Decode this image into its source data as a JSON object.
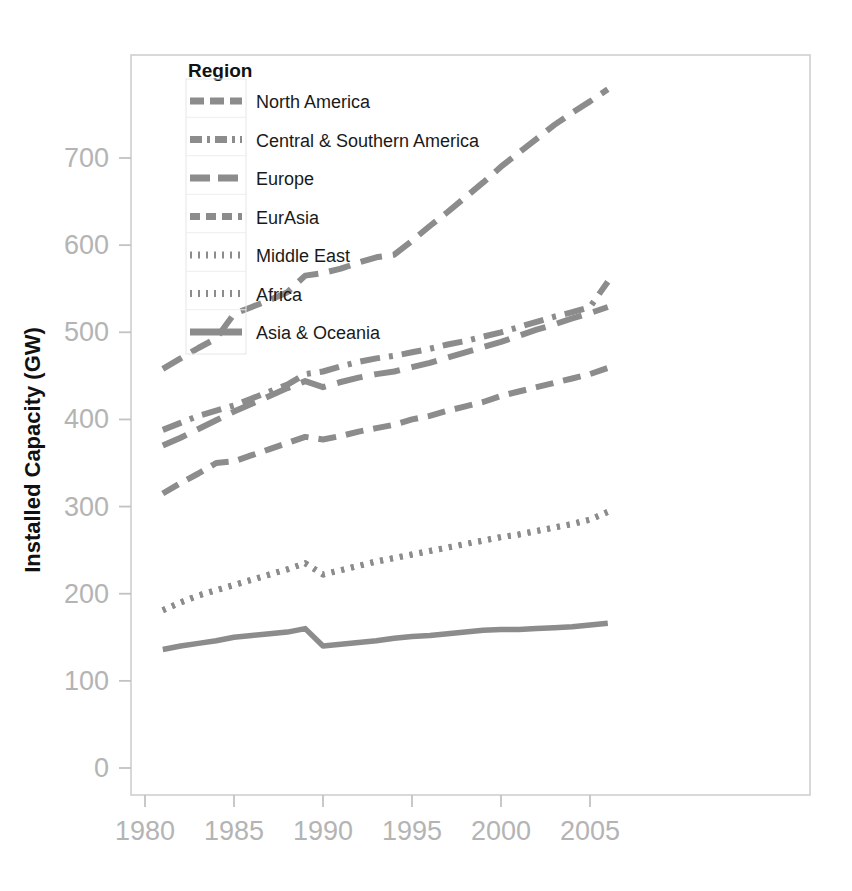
{
  "chart_data": {
    "type": "line",
    "title": "",
    "xlabel": "",
    "ylabel": "Installed Capacity (GW)",
    "xlim": [
      1980,
      2006.5
    ],
    "ylim": [
      0,
      790
    ],
    "grid": false,
    "legend_position": "top-left inside plot",
    "x_ticks": [
      1980,
      1985,
      1990,
      1995,
      2000,
      2005
    ],
    "x_tick_labels": [
      "1980",
      "1985",
      "1990",
      "1995",
      "2000",
      "2005"
    ],
    "y_ticks": [
      0,
      100,
      200,
      300,
      400,
      500,
      600,
      700
    ],
    "y_tick_labels": [
      "0",
      "100",
      "200",
      "300",
      "400",
      "500",
      "600",
      "700"
    ],
    "legend_title": "Region",
    "line_color": "#8c8c8c",
    "x": [
      1981,
      1982,
      1983,
      1984,
      1985,
      1986,
      1987,
      1988,
      1989,
      1990,
      1991,
      1992,
      1993,
      1994,
      1995,
      1996,
      1997,
      1998,
      1999,
      2000,
      2001,
      2002,
      2003,
      2004,
      2005,
      2006
    ],
    "series": [
      {
        "name": "North America",
        "dash": "22,11",
        "values": [
          458,
          470,
          482,
          493,
          521,
          529,
          537,
          546,
          565,
          568,
          573,
          580,
          586,
          589,
          605,
          622,
          638,
          655,
          672,
          690,
          706,
          722,
          738,
          752,
          765,
          779
        ]
      },
      {
        "name": "Central & Southern America",
        "dash": "20,9,4,9",
        "values": [
          388,
          396,
          404,
          410,
          416,
          424,
          432,
          440,
          452,
          455,
          461,
          466,
          470,
          473,
          477,
          481,
          486,
          490,
          495,
          500,
          506,
          512,
          518,
          523,
          529,
          558
        ]
      },
      {
        "name": "Europe",
        "dash": "26,12",
        "values": [
          370,
          379,
          389,
          399,
          409,
          418,
          427,
          436,
          444,
          437,
          443,
          448,
          452,
          455,
          460,
          465,
          471,
          477,
          483,
          489,
          496,
          503,
          509,
          516,
          522,
          529
        ]
      },
      {
        "name": "EurAsia",
        "dash": "18,10",
        "values": [
          315,
          327,
          338,
          350,
          352,
          359,
          366,
          373,
          380,
          377,
          381,
          386,
          390,
          394,
          400,
          404,
          410,
          415,
          420,
          427,
          432,
          437,
          442,
          447,
          452,
          459
        ]
      },
      {
        "name": "Middle East",
        "dash": "3,7",
        "values": [
          181,
          190,
          198,
          204,
          210,
          216,
          222,
          228,
          235,
          222,
          227,
          232,
          237,
          241,
          245,
          249,
          253,
          257,
          261,
          265,
          268,
          272,
          276,
          280,
          285,
          294
        ]
      },
      {
        "name": "Africa",
        "dash": "3,7",
        "values": [
          181,
          190,
          198,
          204,
          210,
          216,
          222,
          228,
          235,
          222,
          227,
          232,
          237,
          241,
          245,
          249,
          253,
          257,
          261,
          265,
          268,
          272,
          276,
          280,
          285,
          294
        ]
      },
      {
        "name": "Asia & Oceania",
        "dash": "0",
        "values": [
          136,
          140,
          143,
          146,
          150,
          152,
          154,
          156,
          160,
          140,
          142,
          144,
          146,
          149,
          151,
          152,
          154,
          156,
          158,
          159,
          159,
          160,
          161,
          162,
          164,
          166
        ]
      }
    ],
    "legend_entries": [
      {
        "label": "North America",
        "dash": "14,6"
      },
      {
        "label": "Central & Southern America",
        "dash": "12,5,3,5"
      },
      {
        "label": "Europe",
        "dash": "20,8"
      },
      {
        "label": "EurAsia",
        "dash": "10,6"
      },
      {
        "label": "Middle East",
        "dash": "2,6"
      },
      {
        "label": "Africa",
        "dash": "2,6"
      },
      {
        "label": "Asia & Oceania",
        "dash": "0"
      }
    ]
  }
}
